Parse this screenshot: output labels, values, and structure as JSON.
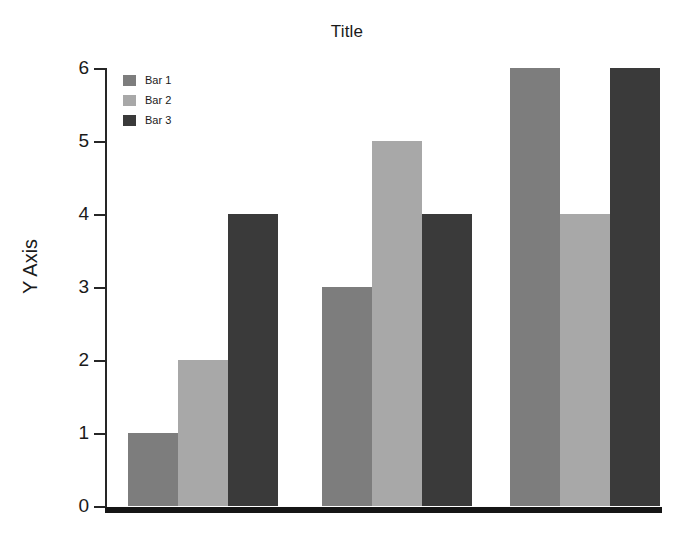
{
  "chart_data": {
    "type": "bar",
    "title": "Title",
    "xlabel": "",
    "ylabel": "Y Axis",
    "categories": [
      "Group 1",
      "Group 2",
      "Group 3"
    ],
    "series": [
      {
        "name": "Bar 1",
        "color": "#7d7d7d",
        "values": [
          1,
          3,
          6
        ]
      },
      {
        "name": "Bar 2",
        "color": "#a8a8a8",
        "values": [
          2,
          5,
          4
        ]
      },
      {
        "name": "Bar 3",
        "color": "#3a3a3a",
        "values": [
          4,
          4,
          6
        ]
      }
    ],
    "ylim": [
      0,
      6
    ],
    "yticks": [
      0,
      1,
      2,
      3,
      4,
      5,
      6
    ],
    "yticklabels": [
      "0",
      "1",
      "2",
      "3",
      "4",
      "5",
      "6"
    ],
    "xticklabels": [],
    "grid": false,
    "legend": {
      "position": "upper left",
      "entries": [
        "Bar 1",
        "Bar 2",
        "Bar 3"
      ]
    },
    "background": "#ffffff",
    "axis_color": "#262626",
    "baseline_color": "#151515"
  }
}
